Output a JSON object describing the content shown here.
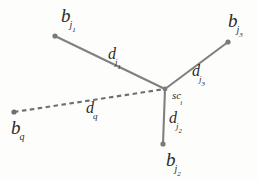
{
  "figure": {
    "type": "node-link-diagram",
    "width": 258,
    "height": 181,
    "background_color": "#fdfdfc",
    "line_color": "#808080",
    "node_color": "#7a7a7a",
    "text_color": "#2b2b2b"
  },
  "nodes": [
    {
      "id": "b_j1",
      "label_base": "b",
      "label_sub": "j",
      "label_subsub": "1",
      "x": 55,
      "y": 36,
      "label_x": 61,
      "label_y": 6
    },
    {
      "id": "b_j3",
      "label_base": "b",
      "label_sub": "j",
      "label_subsub": "3",
      "x": 228,
      "y": 42,
      "label_x": 228,
      "label_y": 11
    },
    {
      "id": "b_j2",
      "label_base": "b",
      "label_sub": "j",
      "label_subsub": "2",
      "x": 163,
      "y": 144,
      "label_x": 166,
      "label_y": 150
    },
    {
      "id": "b_q",
      "label_base": "b",
      "label_sub": "q",
      "label_subsub": "",
      "x": 14,
      "y": 112,
      "label_x": 11,
      "label_y": 118
    }
  ],
  "center": {
    "id": "sc_i",
    "label_base": "sc",
    "label_sub": "i",
    "label_subsub": "",
    "x": 165,
    "y": 89,
    "label_x": 172,
    "label_y": 86
  },
  "edges": [
    {
      "id": "edge-d-j1",
      "from": "b_j1",
      "to": "sc_i",
      "style": "solid",
      "label_base": "d",
      "label_sub": "j",
      "label_subsub": "1",
      "label_x": 108,
      "label_y": 46
    },
    {
      "id": "edge-d-j3",
      "from": "b_j3",
      "to": "sc_i",
      "style": "solid",
      "label_base": "d",
      "label_sub": "j",
      "label_subsub": "3",
      "label_x": 192,
      "label_y": 63
    },
    {
      "id": "edge-d-j2",
      "from": "b_j2",
      "to": "sc_i",
      "style": "solid",
      "label_base": "d",
      "label_sub": "j",
      "label_subsub": "2",
      "label_x": 169,
      "label_y": 110
    },
    {
      "id": "edge-d-q",
      "from": "b_q",
      "to": "sc_i",
      "style": "dashed",
      "label_base": "d",
      "label_sub": "q",
      "label_subsub": "",
      "label_x": 86,
      "label_y": 100
    }
  ]
}
